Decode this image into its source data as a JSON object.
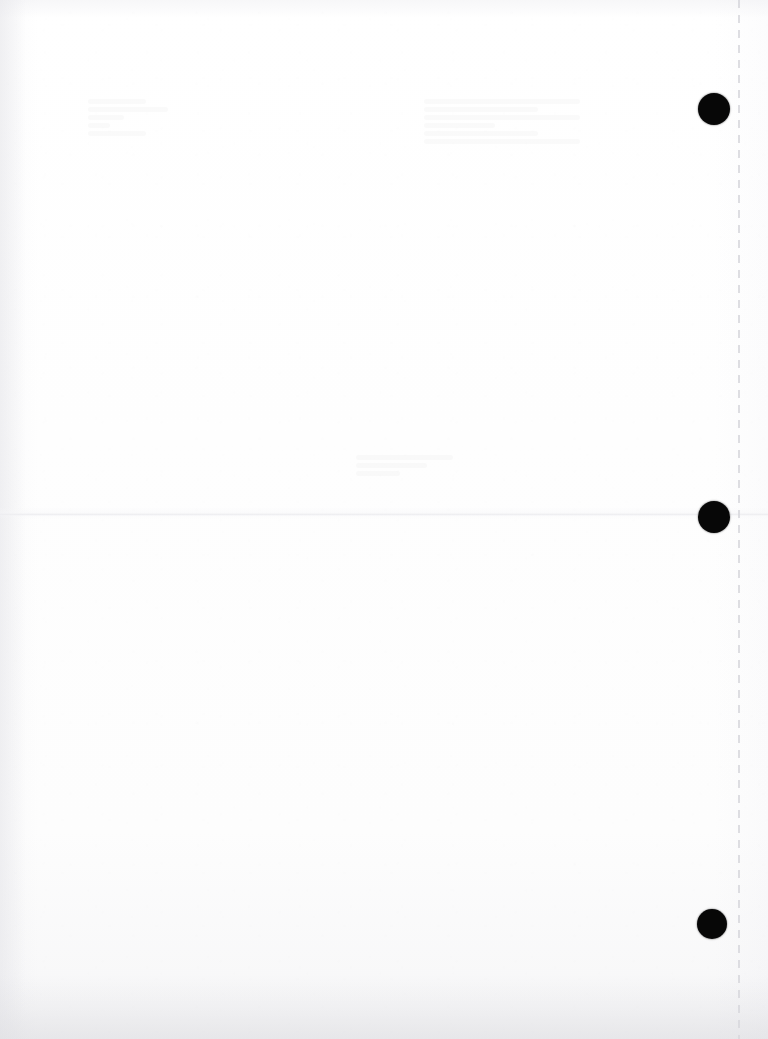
{
  "document": {
    "page_label": "",
    "background_color": "#ffffff",
    "width": 768,
    "height": 1039,
    "content_text": ""
  },
  "artifacts": {
    "fold_crease": {
      "name": "horizontal-fold-crease",
      "y": 513,
      "color": "#e7e7eb"
    },
    "perforation": {
      "name": "vertical-perforation-line",
      "x": 738,
      "color": "#d8d8dd",
      "dash_length": 8,
      "gap_length": 7
    },
    "registration_marks": [
      {
        "id": "top-mark",
        "cx": 714,
        "cy": 109,
        "r": 16,
        "color": "#070707"
      },
      {
        "id": "middle-mark",
        "cx": 714,
        "cy": 517,
        "r": 16,
        "color": "#070707"
      },
      {
        "id": "bottom-mark",
        "cx": 712,
        "cy": 924,
        "r": 15,
        "color": "#070707"
      }
    ],
    "ghost_smudges": [
      {
        "id": "ghost-upper-left",
        "x": 88,
        "y": 96,
        "w": 86,
        "h": 70
      },
      {
        "id": "ghost-upper-right",
        "x": 424,
        "y": 96,
        "w": 168,
        "h": 86
      },
      {
        "id": "ghost-mid-center",
        "x": 356,
        "y": 452,
        "w": 104,
        "h": 38
      }
    ]
  }
}
